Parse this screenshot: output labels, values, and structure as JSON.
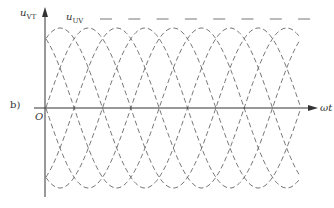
{
  "figure": {
    "panel_label": "b)",
    "y_axis_label": "u",
    "y_axis_sub": "VT",
    "curve_label": "u",
    "curve_label_sub": "UV",
    "origin_label": "O",
    "x_axis_label": "ωt"
  },
  "geometry": {
    "axis_y": 108,
    "y_axis_x": 45,
    "amplitude": 80,
    "period_px": 170,
    "phase_step_px": 28.33,
    "x_start": 46,
    "x_end": 300,
    "phases": 6
  },
  "colors": {
    "stroke": "#666666",
    "axis": "#333333"
  }
}
